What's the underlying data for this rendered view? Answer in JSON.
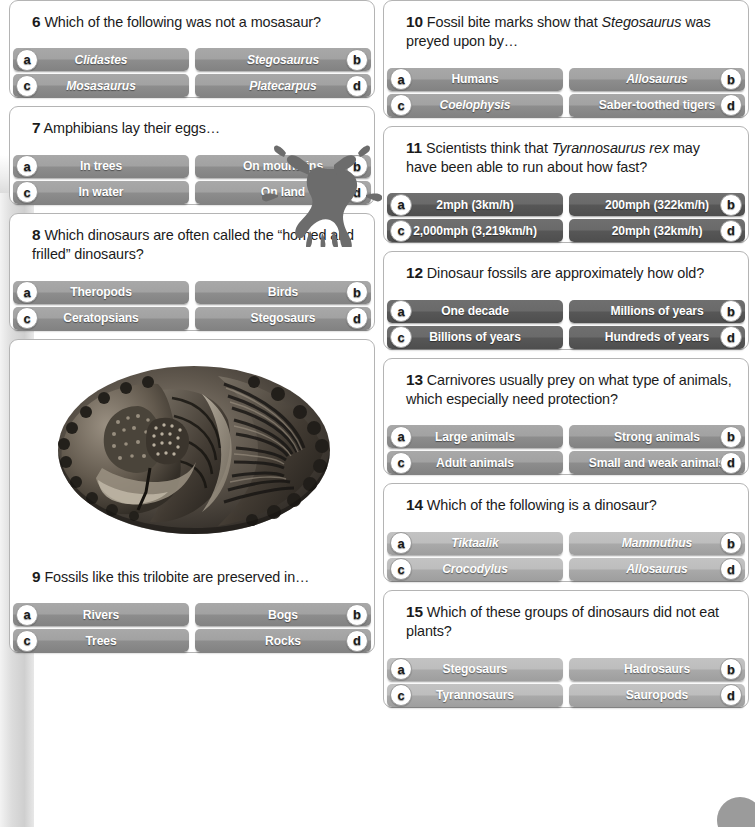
{
  "page": {
    "decor": {
      "frog": "frog-silhouette",
      "fossil_photo": "trilobite-fossil-photo",
      "left_band": "gray-side-band",
      "corner_blob": "page-corner-circle"
    }
  },
  "columns": {
    "left": [
      {
        "number": "6",
        "text_parts": [
          {
            "t": "Which of the following was not a mosasaur?",
            "i": false
          }
        ],
        "tone": "tone-mid",
        "italic_answers": true,
        "has_image": false,
        "answers": [
          {
            "letter": "a",
            "label": "Clidastes"
          },
          {
            "letter": "b",
            "label": "Stegosaurus"
          },
          {
            "letter": "c",
            "label": "Mosasaurus"
          },
          {
            "letter": "d",
            "label": "Platecarpus"
          }
        ]
      },
      {
        "number": "7",
        "text_parts": [
          {
            "t": "Amphibians lay their eggs…",
            "i": false
          }
        ],
        "tone": "tone-mid",
        "italic_answers": false,
        "has_image": false,
        "answers": [
          {
            "letter": "a",
            "label": "In trees"
          },
          {
            "letter": "b",
            "label": "On mountains"
          },
          {
            "letter": "c",
            "label": "In water"
          },
          {
            "letter": "d",
            "label": "On land"
          }
        ]
      },
      {
        "number": "8",
        "text_parts": [
          {
            "t": "Which dinosaurs are often called the “horned and frilled” dinosaurs?",
            "i": false
          }
        ],
        "tone": "tone-mid",
        "italic_answers": false,
        "has_image": false,
        "answers": [
          {
            "letter": "a",
            "label": "Theropods"
          },
          {
            "letter": "b",
            "label": "Birds"
          },
          {
            "letter": "c",
            "label": "Ceratopsians"
          },
          {
            "letter": "d",
            "label": "Stegosaurs"
          }
        ]
      },
      {
        "number": "9",
        "text_parts": [
          {
            "t": "Fossils like this trilobite are preserved in…",
            "i": false
          }
        ],
        "tone": "tone-mid",
        "italic_answers": false,
        "has_image": true,
        "answers": [
          {
            "letter": "a",
            "label": "Rivers"
          },
          {
            "letter": "b",
            "label": "Bogs"
          },
          {
            "letter": "c",
            "label": "Trees"
          },
          {
            "letter": "d",
            "label": "Rocks"
          }
        ]
      }
    ],
    "right": [
      {
        "number": "10",
        "text_parts": [
          {
            "t": "Fossil bite marks show that ",
            "i": false
          },
          {
            "t": "Stegosaurus",
            "i": true
          },
          {
            "t": " was preyed upon by…",
            "i": false
          }
        ],
        "tone": "tone-mid",
        "italic_answers": false,
        "has_image": false,
        "answers": [
          {
            "letter": "a",
            "label": "Humans",
            "italic": false
          },
          {
            "letter": "b",
            "label": "Allosaurus",
            "italic": true
          },
          {
            "letter": "c",
            "label": "Coelophysis",
            "italic": true
          },
          {
            "letter": "d",
            "label": "Saber-toothed tigers",
            "italic": false
          }
        ]
      },
      {
        "number": "11",
        "text_parts": [
          {
            "t": "Scientists think that ",
            "i": false
          },
          {
            "t": "Tyrannosaurus rex",
            "i": true
          },
          {
            "t": " may have been able to run about how fast?",
            "i": false
          }
        ],
        "tone": "tone-dark",
        "italic_answers": false,
        "has_image": false,
        "answers": [
          {
            "letter": "a",
            "label": "2mph (3km/h)"
          },
          {
            "letter": "b",
            "label": "200mph (322km/h)"
          },
          {
            "letter": "c",
            "label": "2,000mph (3,219km/h)"
          },
          {
            "letter": "d",
            "label": "20mph (32km/h)"
          }
        ]
      },
      {
        "number": "12",
        "text_parts": [
          {
            "t": "Dinosaur fossils are approximately how old?",
            "i": false
          }
        ],
        "tone": "tone-dark",
        "italic_answers": false,
        "has_image": false,
        "answers": [
          {
            "letter": "a",
            "label": "One decade"
          },
          {
            "letter": "b",
            "label": "Millions of years"
          },
          {
            "letter": "c",
            "label": "Billions of years"
          },
          {
            "letter": "d",
            "label": "Hundreds of years"
          }
        ]
      },
      {
        "number": "13",
        "text_parts": [
          {
            "t": "Carnivores usually prey on what type of animals, which especially need protection?",
            "i": false
          }
        ],
        "tone": "tone-mid",
        "italic_answers": false,
        "has_image": false,
        "answers": [
          {
            "letter": "a",
            "label": "Large animals"
          },
          {
            "letter": "b",
            "label": "Strong animals"
          },
          {
            "letter": "c",
            "label": "Adult animals"
          },
          {
            "letter": "d",
            "label": "Small and weak animals"
          }
        ]
      },
      {
        "number": "14",
        "text_parts": [
          {
            "t": "Which of the following is a dinosaur?",
            "i": false
          }
        ],
        "tone": "tone-light",
        "italic_answers": true,
        "has_image": false,
        "answers": [
          {
            "letter": "a",
            "label": "Tiktaalik"
          },
          {
            "letter": "b",
            "label": "Mammuthus"
          },
          {
            "letter": "c",
            "label": "Crocodylus"
          },
          {
            "letter": "d",
            "label": "Allosaurus"
          }
        ]
      },
      {
        "number": "15",
        "text_parts": [
          {
            "t": "Which of these groups of dinosaurs did not eat plants?",
            "i": false
          }
        ],
        "tone": "tone-light",
        "italic_answers": false,
        "has_image": false,
        "answers": [
          {
            "letter": "a",
            "label": "Stegosaurs"
          },
          {
            "letter": "b",
            "label": "Hadrosaurs"
          },
          {
            "letter": "c",
            "label": "Tyrannosaurs"
          },
          {
            "letter": "d",
            "label": "Sauropods"
          }
        ]
      }
    ]
  },
  "colors": {
    "card_border": "#b4b4b4",
    "text": "#1b1b1b",
    "button_light": "#bdbdbd",
    "button_mid": "#a2a2a2",
    "button_dark": "#6a6a6a",
    "badge_bg": "#ffffff",
    "band": "#cfcfcf"
  }
}
